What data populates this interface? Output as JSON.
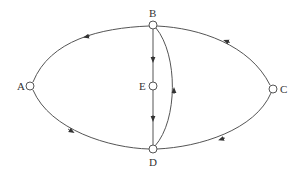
{
  "diagram": {
    "type": "directed-graph",
    "nodes": [
      {
        "id": "A",
        "label": "A",
        "x": 30,
        "y": 86
      },
      {
        "id": "B",
        "label": "B",
        "x": 153,
        "y": 25
      },
      {
        "id": "C",
        "label": "C",
        "x": 273,
        "y": 89
      },
      {
        "id": "D",
        "label": "D",
        "x": 153,
        "y": 149
      },
      {
        "id": "E",
        "label": "E",
        "x": 153,
        "y": 86
      }
    ],
    "edges": [
      {
        "from": "B",
        "to": "A"
      },
      {
        "from": "A",
        "to": "D"
      },
      {
        "from": "C",
        "to": "B"
      },
      {
        "from": "C",
        "to": "D"
      },
      {
        "from": "B",
        "to": "E"
      },
      {
        "from": "E",
        "to": "D"
      },
      {
        "from": "D",
        "to": "B"
      }
    ],
    "colors": {
      "line": "#555555",
      "node_fill": "#ffffff",
      "text": "#333333"
    }
  }
}
